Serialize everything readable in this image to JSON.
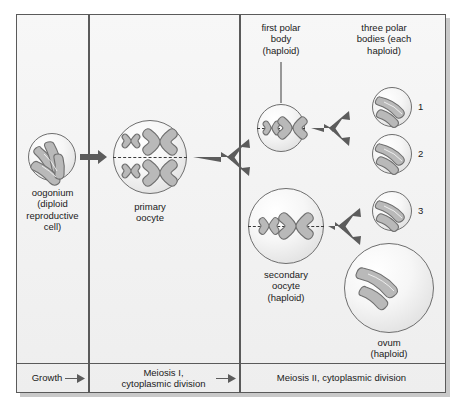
{
  "figure": {
    "accent_color": "#5c5c5c",
    "cell_fill": "#f2f2f2",
    "chromosome_color": "#b9b9b9"
  },
  "labels": {
    "oogonium": "oogonium\n(diploid\nreproductive\ncell)",
    "primary_oocyte": "primary\noocyte",
    "first_polar_body": "first polar\nbody\n(haploid)",
    "three_polar_bodies": "three polar\nbodies (each\nhaploid)",
    "secondary_oocyte": "secondary\noocyte\n(haploid)",
    "ovum": "ovum\n(haploid)"
  },
  "polar_body_numbers": {
    "one": "1",
    "two": "2",
    "three": "3"
  },
  "stages": [
    {
      "label": "Growth"
    },
    {
      "label": "Meiosis I,\ncytoplasmic division"
    },
    {
      "label": "Meiosis II, cytoplasmic division"
    }
  ],
  "cells": [
    {
      "name": "oogonium",
      "ploidy": "diploid",
      "chromosomes": 4,
      "shape": "rod"
    },
    {
      "name": "primary oocyte",
      "ploidy": "diploid",
      "chromosomes": 4,
      "shape": "x"
    },
    {
      "name": "first polar body",
      "ploidy": "haploid",
      "chromosomes": 2,
      "shape": "x"
    },
    {
      "name": "secondary oocyte",
      "ploidy": "haploid",
      "chromosomes": 2,
      "shape": "x"
    },
    {
      "name": "polar body 1",
      "ploidy": "haploid",
      "chromosomes": 2,
      "shape": "rod"
    },
    {
      "name": "polar body 2",
      "ploidy": "haploid",
      "chromosomes": 2,
      "shape": "rod"
    },
    {
      "name": "polar body 3",
      "ploidy": "haploid",
      "chromosomes": 2,
      "shape": "rod"
    },
    {
      "name": "ovum",
      "ploidy": "haploid",
      "chromosomes": 2,
      "shape": "rod"
    }
  ]
}
